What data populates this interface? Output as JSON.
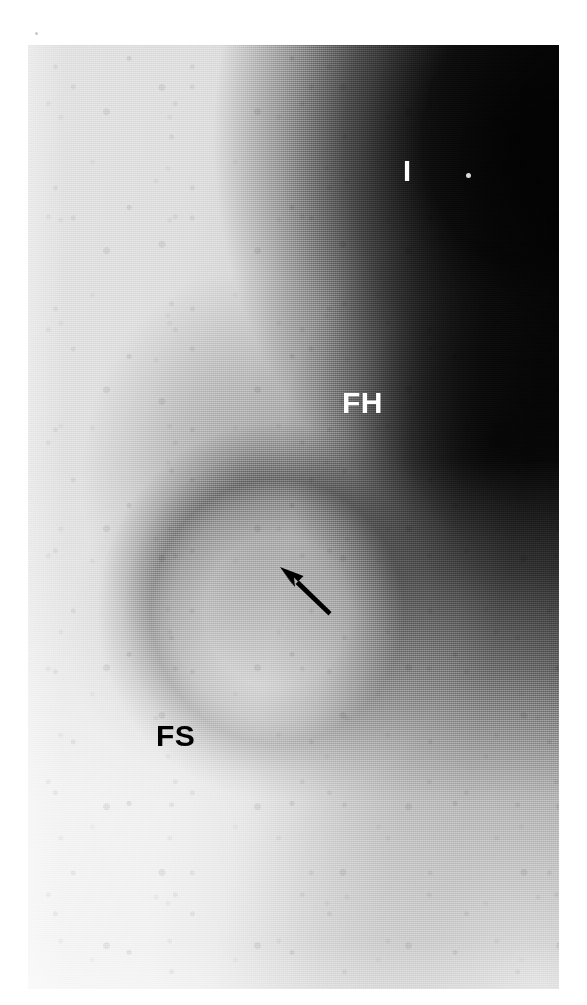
{
  "figure": {
    "kind": "radiograph",
    "modality": "plain film radiograph",
    "region": "hip joint",
    "background_color": "#ffffff",
    "plate": {
      "x": 28,
      "y": 45,
      "width": 531,
      "height": 944,
      "light_tone": "#e2e2e2",
      "mid_tone": "#9b9b9b",
      "dark_tone": "#0c0c0c"
    }
  },
  "annotations": {
    "labels": [
      {
        "id": "label-i",
        "text": "I",
        "meaning": "ilium",
        "color": "#ffffff",
        "style": "light",
        "x": 375,
        "y": 112,
        "font_size": 29
      },
      {
        "id": "label-fh",
        "text": "FH",
        "meaning": "femoral head",
        "color": "#ffffff",
        "style": "light",
        "x": 314,
        "y": 343,
        "font_size": 30
      },
      {
        "id": "label-fs",
        "text": "FS",
        "meaning": "femoral shaft",
        "color": "#000000",
        "style": "dark",
        "x": 128,
        "y": 676,
        "font_size": 30
      }
    ],
    "arrow": {
      "id": "arrow-marker",
      "color": "#000000",
      "points_to": "femoral head-neck junction",
      "direction": "up-left",
      "tail_x": 300,
      "tail_y": 568,
      "tip_x": 253,
      "tip_y": 521
    },
    "speck": {
      "id": "film-speck",
      "color": "#f2f2f2",
      "x": 438,
      "y": 128
    }
  }
}
